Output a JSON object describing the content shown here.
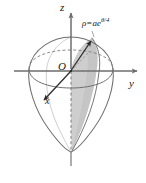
{
  "figure": {
    "axes": {
      "z_label": "z",
      "y_label": "y",
      "x_label": "x",
      "origin_label": "O"
    },
    "annotation": {
      "equation_rho": "ρ",
      "equation_equals": "=",
      "equation_base": "ae",
      "equation_exponent": "θ/4",
      "equation_full": "ρ = ae^(θ/4)"
    },
    "colors": {
      "stroke": "#4a4a4a",
      "stroke_dark": "#2b2b2b",
      "shade_fill": "#c2c2c2",
      "shade_fill_light": "#d4d4d4",
      "axis": "#7a7a7a",
      "background": "#ffffff",
      "text": "#1a1a1a"
    },
    "elements": {
      "outer_surface": "teardrop-surface-of-revolution",
      "equator": "equatorial-ellipse",
      "shaded_sector": "spiral-sector-shaded",
      "radius_arrow": "radius-vector-arrow",
      "dashed_z_axis": "hidden-z-axis-dashed"
    }
  }
}
